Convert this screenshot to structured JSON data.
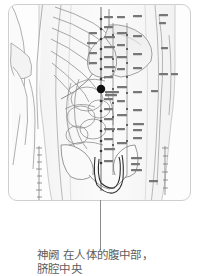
{
  "figure": {
    "type": "anatomical-acupoint-chart",
    "view": "anterior abdomen / torso",
    "panel_label": "human abdomen anatomical illustration",
    "marker": {
      "name": "神阙",
      "pinyin_note": "CV8",
      "x_px": 100,
      "y_px": 88,
      "color": "#111111",
      "radius_px": 4
    },
    "leader_line": {
      "color": "#8d8d8d",
      "from_y": 200,
      "to_y": 250
    }
  },
  "caption": {
    "point": "神阙",
    "line1": "神阙 在人体的腹中部，",
    "line2": "脐腔中央",
    "color": "#5d5d5d"
  },
  "labels": {
    "midline_column": [
      "鸠尾",
      "巨阙",
      "上脘",
      "中脘",
      "建里",
      "下脘",
      "水分",
      "神阙",
      "阴交",
      "气海",
      "石门",
      "关元",
      "中极",
      "曲骨"
    ],
    "lateral_column_inner": [
      "幽门",
      "通谷",
      "阴都",
      "石关",
      "商曲",
      "肓俞",
      "中注",
      "四满",
      "气穴",
      "大赫",
      "横骨"
    ],
    "lateral_column_outer": [
      "不容",
      "承满",
      "梁门",
      "关门",
      "太乙",
      "滑肉门",
      "天枢",
      "外陵",
      "大巨",
      "水道",
      "归来",
      "气冲"
    ],
    "far_lateral_column": [
      "期门",
      "日月",
      "腹哀",
      "大横",
      "腹结",
      "府舍",
      "冲门"
    ],
    "flank_column": [
      "章门",
      "京门",
      "带脉",
      "五枢",
      "维道",
      "居髎"
    ]
  },
  "scales": {
    "left": {
      "name": "left-measure-scale",
      "ticks": 9
    },
    "right": {
      "name": "right-measure-scale",
      "ticks": 7
    }
  },
  "colors": {
    "panel_background": "#fdfdfd",
    "panel_border": "#cfcfcf",
    "outline": "#7a7a7a",
    "organ_fill": "#f0f0f0",
    "bone_fill": "#f7f7f7",
    "marker": "#111111",
    "leader": "#8d8d8d",
    "text": "#5d5d5d"
  }
}
